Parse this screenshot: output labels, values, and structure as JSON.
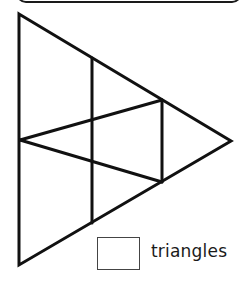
{
  "question": {
    "answer_label": "triangles",
    "answer_value": ""
  },
  "figure": {
    "stroke_color": "#111111",
    "outer_triangle": [
      [
        19,
        14
      ],
      [
        231,
        141
      ],
      [
        19,
        265
      ]
    ],
    "segments": [
      {
        "from": [
          92,
          59
        ],
        "to": [
          92,
          223
        ]
      },
      {
        "from": [
          162,
          100
        ],
        "to": [
          162,
          182
        ]
      },
      {
        "from": [
          20,
          140
        ],
        "to": [
          162,
          100
        ]
      },
      {
        "from": [
          20,
          140
        ],
        "to": [
          162,
          182
        ]
      }
    ]
  }
}
